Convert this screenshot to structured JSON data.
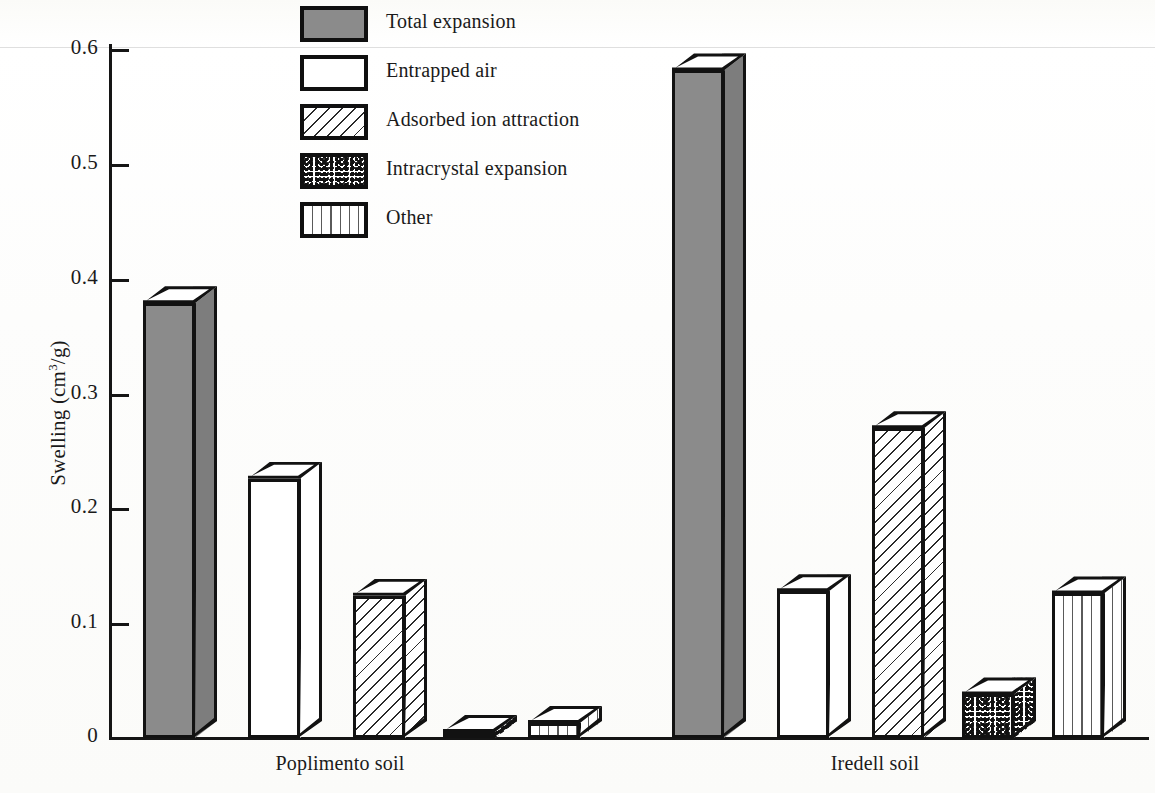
{
  "chart_data": {
    "type": "bar",
    "title": "",
    "xlabel": "",
    "ylabel": "Swelling (cm3/g)",
    "ylabel_parts": {
      "pre": "Swelling (cm",
      "sup": "3",
      "post": "/g)"
    },
    "ylim": [
      0,
      0.6
    ],
    "ytick_labels": [
      "0.6",
      "0.5",
      "0.4",
      "0.3",
      "0.2",
      "0.1",
      "0"
    ],
    "ytick_values": [
      0.6,
      0.5,
      0.4,
      0.3,
      0.2,
      0.1,
      0
    ],
    "grid": false,
    "legend_position": "top-center",
    "categories": [
      "Poplimento soil",
      "Iredell soil"
    ],
    "series": [
      {
        "name": "Total expansion",
        "pattern": "solid-gray",
        "values": [
          0.379,
          0.582
        ]
      },
      {
        "name": "Entrapped air",
        "pattern": "white",
        "values": [
          0.226,
          0.128
        ]
      },
      {
        "name": "Adsorbed ion attraction",
        "pattern": "diagonal",
        "values": [
          0.124,
          0.27
        ]
      },
      {
        "name": "Intracrystal expansion",
        "pattern": "stipple",
        "values": [
          0.003,
          0.038
        ]
      },
      {
        "name": "Other",
        "pattern": "vertical",
        "values": [
          0.013,
          0.126
        ]
      }
    ]
  },
  "legend": {
    "items": [
      {
        "label": "Total expansion",
        "swatch": "solid-gray-swatch"
      },
      {
        "label": "Entrapped air",
        "swatch": "white-swatch"
      },
      {
        "label": "Adsorbed ion attraction",
        "swatch": "diagonal-hatch-swatch"
      },
      {
        "label": "Intracrystal expansion",
        "swatch": "stipple-swatch"
      },
      {
        "label": "Other",
        "swatch": "vertical-hatch-swatch"
      }
    ]
  },
  "axis": {
    "y_title_pre": "Swelling (cm",
    "y_title_sup": "3",
    "y_title_post": "/g)",
    "ticks": [
      "0.6",
      "0.5",
      "0.4",
      "0.3",
      "0.2",
      "0.1",
      "0"
    ]
  },
  "categories": {
    "group1": "Poplimento soil",
    "group2": "Iredell soil"
  },
  "colors": {
    "ink": "#121212",
    "solid_fill": "#8b8b8b",
    "paper": "#fdfdfb"
  }
}
